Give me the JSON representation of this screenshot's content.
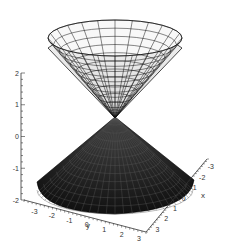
{
  "chart_data": {
    "type": "surface3d",
    "title": "",
    "xlabel": "x",
    "ylabel": "y",
    "zlabel": "",
    "x_ticks": [
      "-3",
      "-2",
      "-1",
      "0",
      "1",
      "2",
      "3"
    ],
    "y_ticks": [
      "-3",
      "-2",
      "-1",
      "0",
      "1",
      "2",
      "3"
    ],
    "z_ticks": [
      "2",
      "1",
      "0",
      "-1",
      "-2"
    ],
    "xlim": [
      -3,
      3
    ],
    "ylim": [
      -3,
      3
    ],
    "zlim": [
      -2,
      2
    ],
    "series": [
      {
        "name": "upper cone",
        "equation": "z = sqrt(x^2+y^2)",
        "color": "#e8e8e8"
      },
      {
        "name": "lower cone",
        "equation": "z = -sqrt(x^2+y^2)",
        "color": "#1a1a1a"
      }
    ]
  },
  "axes": {
    "z_labels": [
      "2",
      "1",
      "0",
      "-1",
      "-2"
    ],
    "y_labels": [
      "-3",
      "-2",
      "-1",
      "0",
      "1",
      "2",
      "3"
    ],
    "x_labels": [
      "-3",
      "-2",
      "-1",
      "0",
      "1",
      "2",
      "3"
    ],
    "x_title": "x",
    "y_title": "y"
  }
}
